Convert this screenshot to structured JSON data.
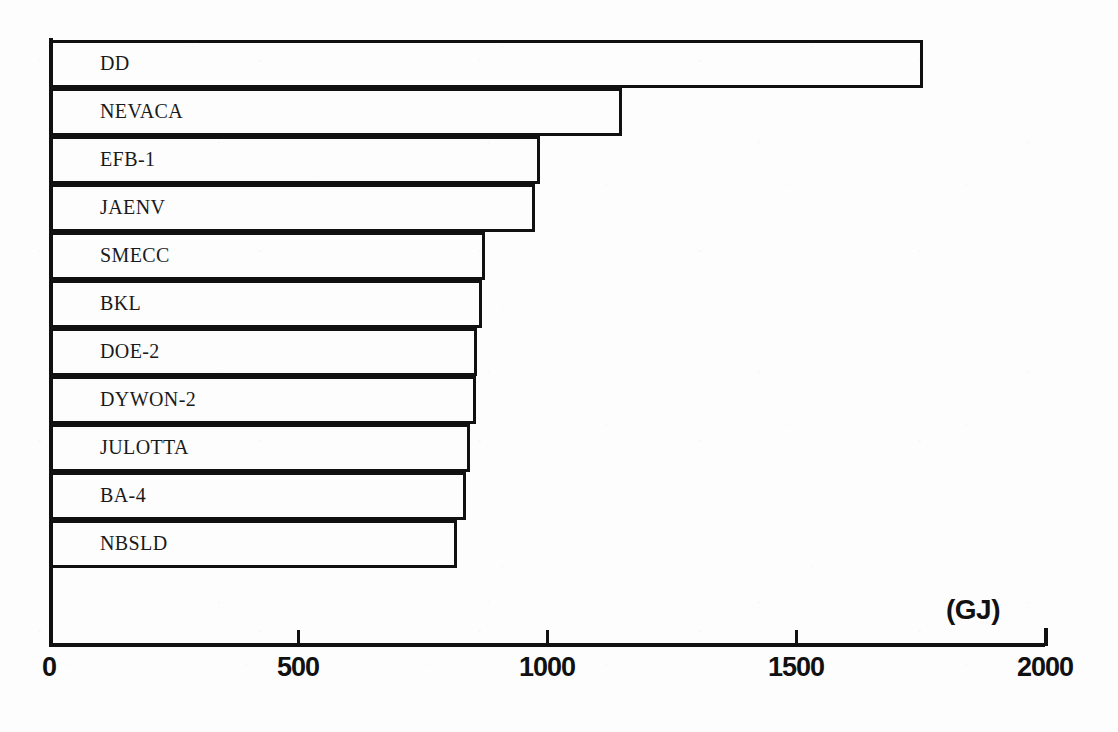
{
  "chart_data": {
    "type": "bar",
    "orientation": "horizontal",
    "title": "",
    "subtitle": "",
    "xlabel": "(GJ)",
    "ylabel": "",
    "unit": "GJ",
    "xlim": [
      0,
      2000
    ],
    "xticks": [
      0,
      500,
      1000,
      1500,
      2000
    ],
    "xticklabels": [
      "0",
      "500",
      "1000",
      "1500",
      "2000"
    ],
    "grid": false,
    "legend": false,
    "categories": [
      "DD",
      "NEVACA",
      "EFB-1",
      "JAENV",
      "SMECC",
      "BKL",
      "DOE-2",
      "DYWON-2",
      "JULOTTA",
      "BA-4",
      "NBSLD"
    ],
    "values": [
      1755,
      1150,
      985,
      975,
      875,
      870,
      860,
      858,
      845,
      838,
      820
    ],
    "bars": [
      {
        "label": "DD",
        "value": 1755
      },
      {
        "label": "NEVACA",
        "value": 1150
      },
      {
        "label": "EFB-1",
        "value": 985
      },
      {
        "label": "JAENV",
        "value": 975
      },
      {
        "label": "SMECC",
        "value": 875
      },
      {
        "label": "BKL",
        "value": 870
      },
      {
        "label": "DOE-2",
        "value": 860
      },
      {
        "label": "DYWON-2",
        "value": 858
      },
      {
        "label": "JULOTTA",
        "value": 845
      },
      {
        "label": "BA-4",
        "value": 838
      },
      {
        "label": "NBSLD",
        "value": 820
      }
    ],
    "colors": {
      "bar_fill": "#ffffff",
      "bar_edge": "#111111",
      "axis": "#111111",
      "text": "#1a1a1a",
      "background": "#fdfdfd"
    }
  }
}
